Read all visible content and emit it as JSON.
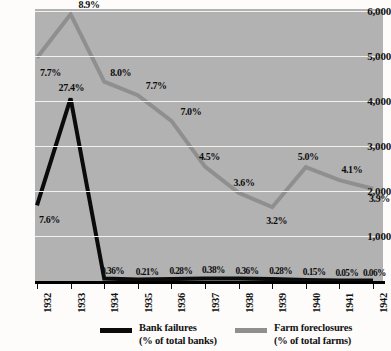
{
  "chart_data": {
    "type": "line",
    "title": "",
    "xlabel": "",
    "ylabel": "",
    "categories": [
      "1932",
      "1933",
      "1934",
      "1935",
      "1936",
      "1937",
      "1938",
      "1939",
      "1940",
      "1941",
      "1942"
    ],
    "ylim": [
      0,
      6000
    ],
    "yticks": [
      1000,
      2000,
      3000,
      4000,
      5000,
      6000
    ],
    "ytick_labels": [
      "1,000",
      "2,000",
      "3,000",
      "4,000",
      "5,000",
      "6,000"
    ],
    "grid": true,
    "legend_position": "bottom",
    "series": [
      {
        "name": "Bank failures",
        "unit": "(% of total banks)",
        "color": "#0b0b0b",
        "labels": [
          "7.6%",
          "27.4%",
          "0.36%",
          "0.21%",
          "0.28%",
          "0.38%",
          "0.36%",
          "0.28%",
          "0.15%",
          "0.05%",
          "0.06%"
        ],
        "values": [
          7.6,
          27.4,
          0.36,
          0.21,
          0.28,
          0.38,
          0.36,
          0.28,
          0.15,
          0.05,
          0.06
        ],
        "plot_values": [
          1680,
          4060,
          55,
          32,
          43,
          58,
          55,
          43,
          23,
          8,
          9
        ]
      },
      {
        "name": "Farm foreclosures",
        "unit": "(% of total farms)",
        "color": "#8f8f8f",
        "labels": [
          "7.7%",
          "8.9%",
          "8.0%",
          "7.7%",
          "7.0%",
          "4.5%",
          "3.6%",
          "3.2%",
          "5.0%",
          "4.1%",
          "3.9%"
        ],
        "values": [
          7.7,
          8.9,
          8.0,
          7.7,
          7.0,
          4.5,
          3.6,
          3.2,
          5.0,
          4.1,
          3.9
        ],
        "plot_values": [
          4960,
          5930,
          4430,
          4130,
          3560,
          2540,
          1960,
          1640,
          2530,
          2240,
          2050
        ]
      }
    ]
  },
  "y_axis": {
    "labels": [
      "6,000",
      "5,000",
      "4,000",
      "3,000",
      "2,000",
      "1,000"
    ]
  },
  "x_axis": {
    "labels": [
      "1932",
      "1933",
      "1934",
      "1935",
      "1936",
      "1937",
      "1938",
      "1939",
      "1940",
      "1941",
      "1942"
    ]
  },
  "data_labels": {
    "bank": [
      "7.6%",
      "27.4%",
      "0.36%",
      "0.21%",
      "0.28%",
      "0.38%",
      "0.36%",
      "0.28%",
      "0.15%",
      "0.05%",
      "0.06%"
    ],
    "farm": [
      "7.7%",
      "8.9%",
      "8.0%",
      "7.7%",
      "7.0%",
      "4.5%",
      "3.6%",
      "3.2%",
      "5.0%",
      "4.1%",
      "3.9%"
    ]
  },
  "legend": {
    "bank_name": "Bank failures",
    "bank_unit": "(% of total banks)",
    "farm_name": "Farm foreclosures",
    "farm_unit": "(% of total farms)"
  },
  "colors": {
    "bank_line": "#0b0b0b",
    "farm_line": "#8f8f8f",
    "plot_background": "#b2b2b2",
    "gridline": "#f2f1ee",
    "page_background": "#fdfcfa"
  }
}
